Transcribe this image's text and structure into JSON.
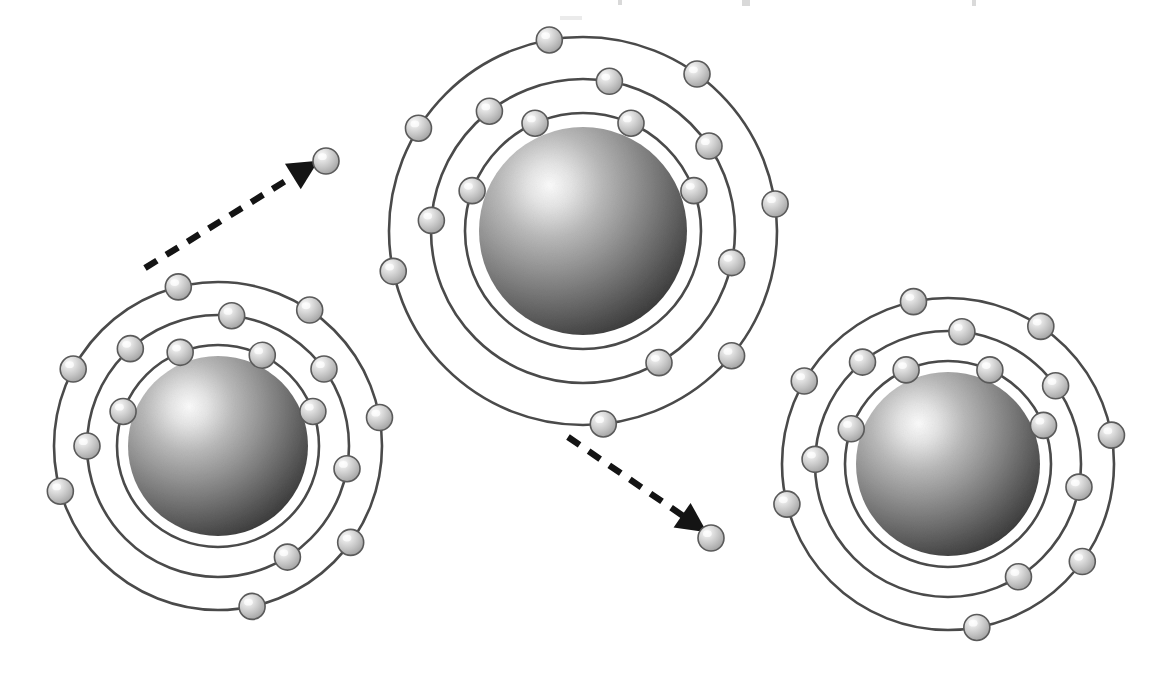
{
  "figure": {
    "background_color": "#ffffff",
    "width": 1166,
    "height": 685,
    "clipped_top_text": ""
  },
  "style": {
    "orbit_stroke": "#4a4a4a",
    "orbit_stroke_width": 2.6,
    "electron_fill_light": "#f2f2f2",
    "electron_fill_mid": "#c9c9c9",
    "electron_fill_dark": "#9a9a9a",
    "electron_stroke": "#5a5a5a",
    "nucleus_highlight": "#f6f6f6",
    "nucleus_mid": "#8e8e8e",
    "nucleus_dark": "#3d3d3d",
    "arrow_color": "#141414",
    "arrow_dash": "14 11",
    "arrow_width": 6.4
  },
  "atoms": [
    {
      "id": "atom-left",
      "label": "left-atom",
      "cx": 218,
      "cy": 446,
      "nucleus_radius": 90,
      "shells": [
        {
          "name": "inner-shell",
          "radius": 101,
          "electron_angles": [
            20,
            64,
            112,
            160
          ]
        },
        {
          "name": "middle-shell",
          "radius": 131,
          "electron_angles": [
            -58,
            -10,
            36,
            84,
            132,
            180
          ]
        },
        {
          "name": "outer-shell",
          "radius": 164,
          "electron_angles": [
            -78,
            -36,
            10,
            56,
            104,
            152,
            196
          ]
        }
      ]
    },
    {
      "id": "atom-center",
      "label": "center-atom",
      "cx": 583,
      "cy": 231,
      "nucleus_radius": 104,
      "shells": [
        {
          "name": "inner-shell",
          "radius": 118,
          "electron_angles": [
            20,
            66,
            114,
            160
          ]
        },
        {
          "name": "middle-shell",
          "radius": 152,
          "electron_angles": [
            -60,
            -12,
            34,
            80,
            128,
            176
          ]
        },
        {
          "name": "outer-shell",
          "radius": 194,
          "electron_angles": [
            -84,
            -40,
            8,
            54,
            100,
            148,
            192
          ]
        }
      ]
    },
    {
      "id": "atom-right",
      "label": "right-atom",
      "cx": 948,
      "cy": 464,
      "nucleus_radius": 92,
      "shells": [
        {
          "name": "inner-shell",
          "radius": 103,
          "electron_angles": [
            22,
            66,
            114,
            160
          ]
        },
        {
          "name": "middle-shell",
          "radius": 133,
          "electron_angles": [
            -58,
            -10,
            36,
            84,
            130,
            178
          ]
        },
        {
          "name": "outer-shell",
          "radius": 166,
          "electron_angles": [
            -80,
            -36,
            10,
            56,
            102,
            150,
            194
          ]
        }
      ]
    }
  ],
  "electron_radius": 13,
  "free_electrons": [
    {
      "id": "free-electron-upper",
      "label": "emitted-electron-upper-left",
      "cx": 326,
      "cy": 161,
      "r": 13
    },
    {
      "id": "free-electron-lower",
      "label": "emitted-electron-lower-center",
      "cx": 711,
      "cy": 538,
      "r": 13
    }
  ],
  "transfer_arrows": [
    {
      "id": "arrow-upper-left",
      "label": "electron-transfer-arrow-up-right",
      "from": {
        "x": 145,
        "y": 268
      },
      "to": {
        "x": 300,
        "y": 172
      },
      "head_angle_deg": 32,
      "description": "Dashed arrow from left atom outer-shell electron to free electron"
    },
    {
      "id": "arrow-lower-right",
      "label": "electron-transfer-arrow-down-right",
      "from": {
        "x": 568,
        "y": 437
      },
      "to": {
        "x": 689,
        "y": 520
      },
      "head_angle_deg": -34,
      "description": "Dashed arrow from center atom outer-shell electron to free electron"
    }
  ]
}
